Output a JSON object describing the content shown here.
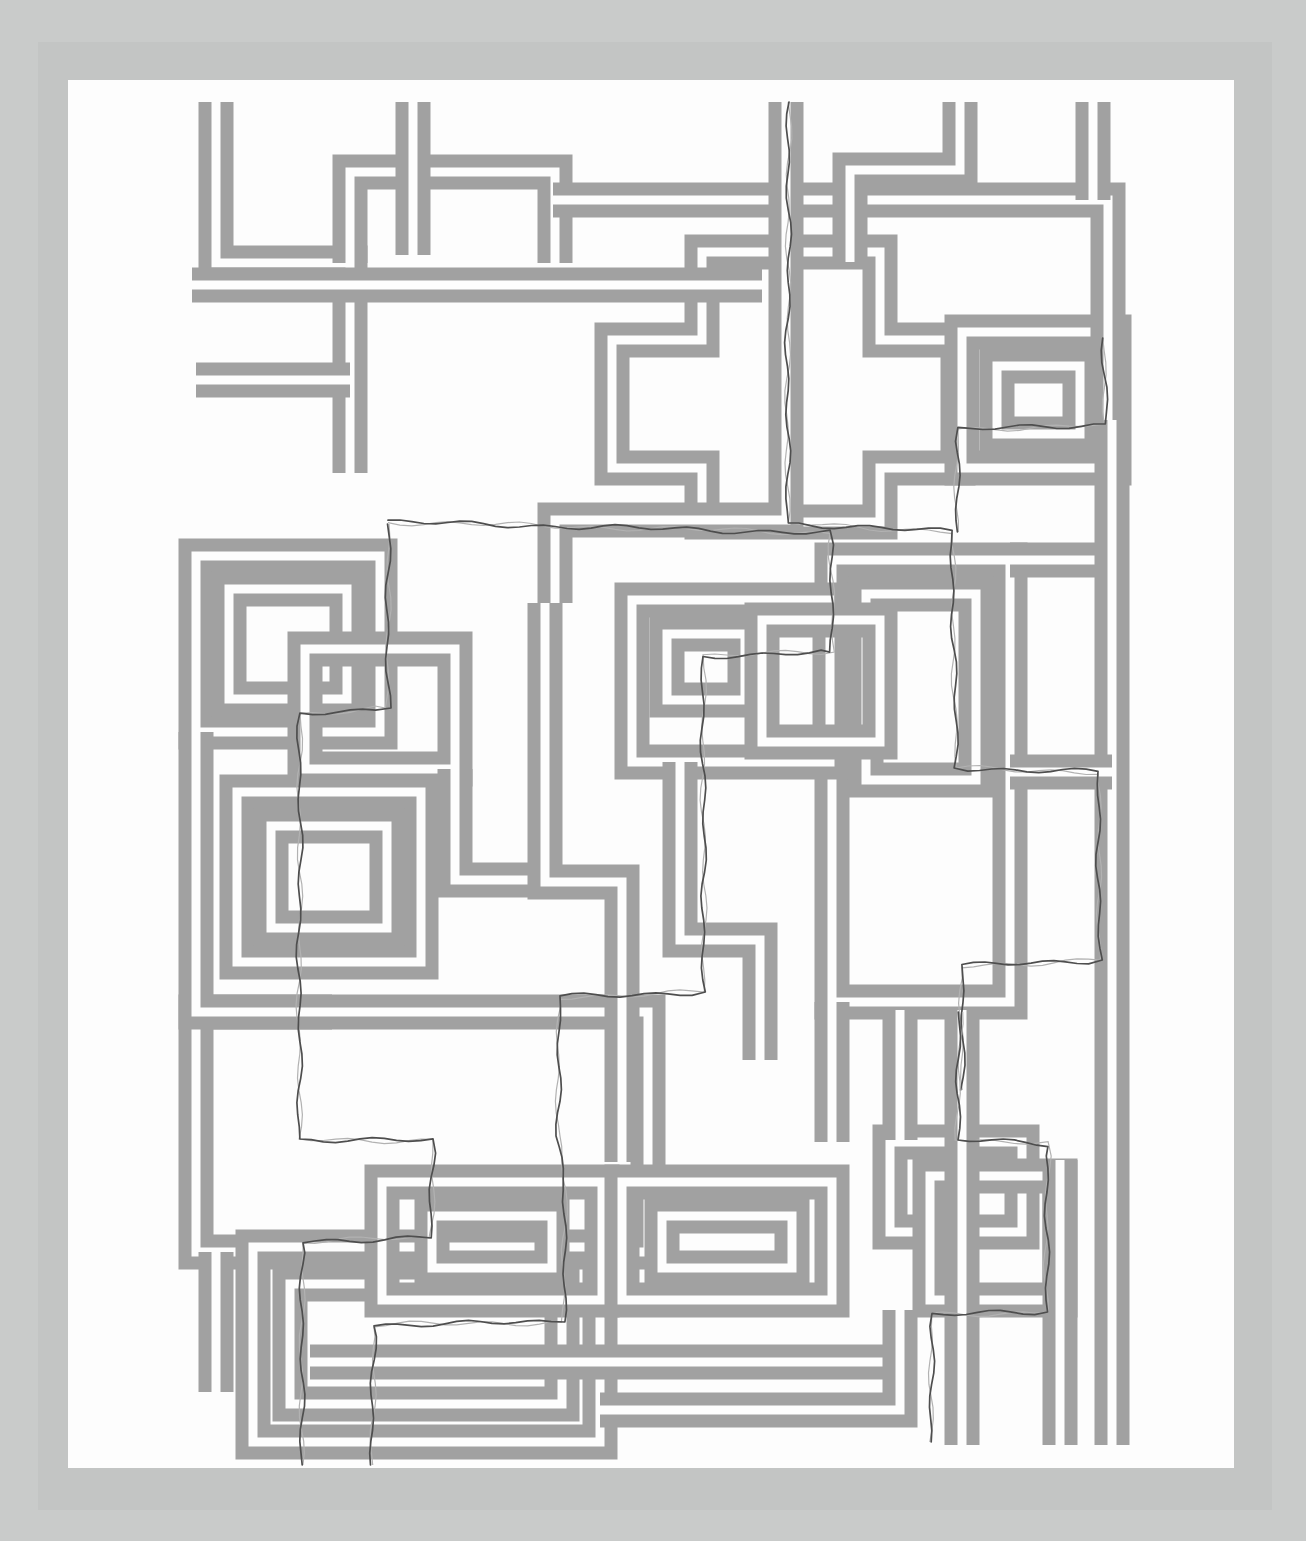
{
  "artwork": {
    "kind": "abstract-maze-print",
    "canvas": {
      "width": 1306,
      "height": 1541
    },
    "colors": {
      "background": "#c9cbca",
      "frame_band": "#c3c5c4",
      "paper": "#fdfdfd",
      "line": "#a1a1a1",
      "thread": "#4e4e4e",
      "thread_echo": "#b2b2b2"
    },
    "frame_band": {
      "x": 38,
      "y": 42,
      "width": 1234,
      "height": 1468
    },
    "paper": {
      "x": 68,
      "y": 80,
      "width": 1166,
      "height": 1388
    },
    "channel": {
      "outer_width": 35,
      "core_width": 9
    },
    "shapes": [
      {
        "closed": true,
        "points": [
          [
            612,
            340
          ],
          [
            702,
            340
          ],
          [
            702,
            252
          ],
          [
            880,
            252
          ],
          [
            880,
            340
          ],
          [
            958,
            340
          ],
          [
            958,
            468
          ],
          [
            880,
            468
          ],
          [
            880,
            522
          ],
          [
            702,
            522
          ],
          [
            702,
            468
          ],
          [
            612,
            468
          ]
        ]
      },
      {
        "closed": true,
        "points": [
          [
            196,
            556
          ],
          [
            380,
            556
          ],
          [
            380,
            732
          ],
          [
            196,
            732
          ]
        ]
      },
      {
        "closed": true,
        "points": [
          [
            229,
            589
          ],
          [
            347,
            589
          ],
          [
            347,
            699
          ],
          [
            229,
            699
          ]
        ]
      },
      {
        "closed": true,
        "points": [
          [
            305,
            649
          ],
          [
            455,
            649
          ],
          [
            455,
            769
          ],
          [
            305,
            769
          ]
        ]
      },
      {
        "closed": true,
        "points": [
          [
            237,
            792
          ],
          [
            421,
            792
          ],
          [
            421,
            962
          ],
          [
            237,
            962
          ]
        ]
      },
      {
        "closed": true,
        "points": [
          [
            271,
            826
          ],
          [
            387,
            826
          ],
          [
            387,
            928
          ],
          [
            271,
            928
          ]
        ]
      },
      {
        "closed": true,
        "points": [
          [
            832,
            560
          ],
          [
            1010,
            560
          ],
          [
            1010,
            1002
          ],
          [
            832,
            1002
          ]
        ]
      },
      {
        "closed": true,
        "points": [
          [
            866,
            594
          ],
          [
            976,
            594
          ],
          [
            976,
            780
          ],
          [
            866,
            780
          ]
        ]
      },
      {
        "closed": true,
        "points": [
          [
            196,
            1012
          ],
          [
            648,
            1012
          ],
          [
            648,
            1252
          ],
          [
            196,
            1252
          ]
        ]
      },
      {
        "closed": true,
        "points": [
          [
            253,
            1247
          ],
          [
            600,
            1247
          ],
          [
            600,
            1442
          ],
          [
            253,
            1442
          ]
        ]
      },
      {
        "closed": true,
        "points": [
          [
            290,
            1284
          ],
          [
            562,
            1284
          ],
          [
            562,
            1404
          ],
          [
            290,
            1404
          ]
        ]
      },
      {
        "closed": true,
        "points": [
          [
            382,
            1182
          ],
          [
            602,
            1182
          ],
          [
            602,
            1300
          ],
          [
            382,
            1300
          ]
        ]
      },
      {
        "closed": true,
        "points": [
          [
            432,
            1216
          ],
          [
            552,
            1216
          ],
          [
            552,
            1268
          ],
          [
            432,
            1268
          ]
        ]
      },
      {
        "closed": true,
        "points": [
          [
            622,
            1182
          ],
          [
            832,
            1182
          ],
          [
            832,
            1300
          ],
          [
            622,
            1300
          ]
        ]
      },
      {
        "closed": true,
        "points": [
          [
            662,
            1216
          ],
          [
            792,
            1216
          ],
          [
            792,
            1268
          ],
          [
            662,
            1268
          ]
        ]
      },
      {
        "closed": true,
        "points": [
          [
            962,
            332
          ],
          [
            1114,
            332
          ],
          [
            1114,
            468
          ],
          [
            962,
            468
          ]
        ]
      },
      {
        "closed": true,
        "points": [
          [
            997,
            366
          ],
          [
            1080,
            366
          ],
          [
            1080,
            434
          ],
          [
            997,
            434
          ]
        ]
      },
      {
        "closed": true,
        "points": [
          [
            632,
            600
          ],
          [
            830,
            600
          ],
          [
            830,
            762
          ],
          [
            632,
            762
          ]
        ]
      },
      {
        "closed": true,
        "points": [
          [
            667,
            634
          ],
          [
            745,
            634
          ],
          [
            745,
            700
          ],
          [
            667,
            700
          ]
        ]
      },
      {
        "closed": true,
        "points": [
          [
            762,
            620
          ],
          [
            880,
            620
          ],
          [
            880,
            742
          ],
          [
            762,
            742
          ]
        ]
      },
      {
        "closed": true,
        "points": [
          [
            890,
            1142
          ],
          [
            1022,
            1142
          ],
          [
            1022,
            1232
          ],
          [
            890,
            1232
          ]
        ]
      },
      {
        "closed": true,
        "points": [
          [
            930,
            1176
          ],
          [
            1060,
            1176
          ],
          [
            1060,
            1300
          ],
          [
            930,
            1300
          ]
        ]
      },
      {
        "closed": false,
        "points": [
          [
            216,
            102
          ],
          [
            216,
            263
          ],
          [
            350,
            263
          ],
          [
            350,
            473
          ]
        ]
      },
      {
        "closed": false,
        "points": [
          [
            350,
            263
          ],
          [
            350,
            172
          ],
          [
            555,
            172
          ],
          [
            555,
            263
          ]
        ]
      },
      {
        "closed": false,
        "points": [
          [
            413,
            102
          ],
          [
            413,
            255
          ]
        ]
      },
      {
        "closed": false,
        "points": [
          [
            553,
            200
          ],
          [
            1108,
            200
          ],
          [
            1108,
            420
          ]
        ]
      },
      {
        "closed": false,
        "points": [
          [
            192,
            285
          ],
          [
            762,
            285
          ]
        ]
      },
      {
        "closed": false,
        "points": [
          [
            960,
            102
          ],
          [
            960,
            170
          ],
          [
            850,
            170
          ],
          [
            850,
            262
          ]
        ]
      },
      {
        "closed": false,
        "points": [
          [
            786,
            102
          ],
          [
            786,
            520
          ],
          [
            555,
            520
          ],
          [
            555,
            603
          ]
        ]
      },
      {
        "closed": false,
        "points": [
          [
            1093,
            102
          ],
          [
            1093,
            200
          ]
        ]
      },
      {
        "closed": false,
        "points": [
          [
            196,
            732
          ],
          [
            196,
            1012
          ],
          [
            332,
            1012
          ]
        ]
      },
      {
        "closed": false,
        "points": [
          [
            455,
            769
          ],
          [
            455,
            880
          ],
          [
            543,
            880
          ]
        ]
      },
      {
        "closed": false,
        "points": [
          [
            545,
            603
          ],
          [
            545,
            882
          ],
          [
            622,
            882
          ],
          [
            622,
            1162
          ]
        ]
      },
      {
        "closed": false,
        "points": [
          [
            680,
            762
          ],
          [
            680,
            940
          ],
          [
            760,
            940
          ],
          [
            760,
            1060
          ]
        ]
      },
      {
        "closed": false,
        "points": [
          [
            1010,
            560
          ],
          [
            1115,
            560
          ]
        ]
      },
      {
        "closed": false,
        "points": [
          [
            1112,
            420
          ],
          [
            1112,
            1445
          ]
        ]
      },
      {
        "closed": false,
        "points": [
          [
            1010,
            772
          ],
          [
            1112,
            772
          ]
        ]
      },
      {
        "closed": false,
        "points": [
          [
            216,
            1252
          ],
          [
            216,
            1392
          ]
        ]
      },
      {
        "closed": false,
        "points": [
          [
            310,
            1362
          ],
          [
            900,
            1362
          ]
        ]
      },
      {
        "closed": false,
        "points": [
          [
            600,
            1410
          ],
          [
            900,
            1410
          ],
          [
            900,
            1310
          ]
        ]
      },
      {
        "closed": false,
        "points": [
          [
            900,
            1010
          ],
          [
            900,
            1140
          ]
        ]
      },
      {
        "closed": false,
        "points": [
          [
            962,
            1010
          ],
          [
            962,
            1445
          ]
        ]
      },
      {
        "closed": false,
        "points": [
          [
            1060,
            1160
          ],
          [
            1060,
            1445
          ]
        ]
      },
      {
        "closed": false,
        "points": [
          [
            832,
            1002
          ],
          [
            832,
            1142
          ]
        ]
      },
      {
        "closed": false,
        "points": [
          [
            196,
            380
          ],
          [
            350,
            380
          ]
        ]
      }
    ],
    "threads": {
      "width": 1.7,
      "echo_width": 1.2,
      "paths": [
        [
          [
            789,
            102
          ],
          [
            787,
            523
          ],
          [
            952,
            532
          ],
          [
            956,
            768
          ],
          [
            1098,
            772
          ],
          [
            1100,
            960
          ],
          [
            962,
            966
          ],
          [
            962,
            1090
          ]
        ],
        [
          [
            388,
            524
          ],
          [
            388,
            708
          ],
          [
            300,
            714
          ],
          [
            299,
            1139
          ],
          [
            433,
            1141
          ],
          [
            431,
            1238
          ],
          [
            303,
            1241
          ],
          [
            301,
            1465
          ]
        ],
        [
          [
            388,
            522
          ],
          [
            830,
            533
          ],
          [
            833,
            652
          ],
          [
            703,
            656
          ],
          [
            704,
            992
          ],
          [
            560,
            997
          ],
          [
            557,
            1136
          ],
          [
            566,
            1190
          ],
          [
            563,
            1322
          ],
          [
            374,
            1325
          ],
          [
            372,
            1465
          ]
        ],
        [
          [
            1104,
            338
          ],
          [
            1106,
            424
          ],
          [
            958,
            430
          ],
          [
            956,
            532
          ]
        ],
        [
          [
            960,
            1012
          ],
          [
            958,
            1140
          ],
          [
            1048,
            1144
          ],
          [
            1046,
            1312
          ],
          [
            932,
            1315
          ],
          [
            930,
            1442
          ]
        ]
      ]
    }
  }
}
